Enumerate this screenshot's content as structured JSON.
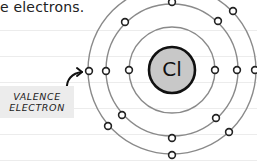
{
  "caption": {
    "text": "e electrons."
  },
  "label": {
    "line1": "VALENCE",
    "line2": "ELECTRON"
  },
  "atom": {
    "symbol": "Cl",
    "nucleus_color": "#c8c8c8",
    "shells": [
      {
        "name": "inner",
        "electrons": 2
      },
      {
        "name": "middle",
        "electrons": 8
      },
      {
        "name": "outer",
        "electrons": 7
      }
    ]
  },
  "colors": {
    "orbit": "#8a8a8a",
    "electron_stroke": "#222222",
    "label_bg": "#ececec"
  }
}
